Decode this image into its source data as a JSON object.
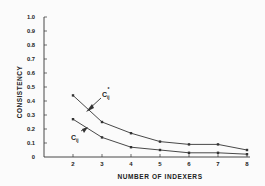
{
  "chart_data": {
    "type": "line",
    "title": "",
    "xlabel": "NUMBER OF INDEXERS",
    "ylabel": "CONSISTENCY",
    "x": [
      2,
      3,
      4,
      5,
      6,
      7,
      8
    ],
    "x_tick_labels": [
      "2",
      "3",
      "4",
      "5",
      "6",
      "7",
      "8"
    ],
    "y_tick_labels": [
      "0",
      "0.1",
      "0.2",
      "0.3",
      "0.4",
      "0.5",
      "0.6",
      "0.7",
      "0.8",
      "0.9",
      "1.0"
    ],
    "ylim": [
      0,
      1.0
    ],
    "xlim": [
      1,
      8
    ],
    "grid": false,
    "legend_position": "inline annotations with arrows",
    "series": [
      {
        "name": "C*ij",
        "label_main": "C",
        "label_sub": "ij",
        "label_sup": "*",
        "values": [
          0.44,
          0.25,
          0.17,
          0.11,
          0.09,
          0.09,
          0.05
        ]
      },
      {
        "name": "Cij",
        "label_main": "C",
        "label_sub": "ij",
        "label_sup": "",
        "values": [
          0.27,
          0.14,
          0.07,
          0.05,
          0.03,
          0.03,
          0.02
        ]
      }
    ],
    "colors": {
      "line": "#333333",
      "axis": "#333333",
      "text": "#222222"
    }
  }
}
